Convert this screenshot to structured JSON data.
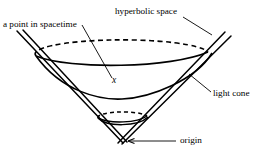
{
  "figure": {
    "type": "diagram",
    "background_color": "#ffffff",
    "stroke_color": "#000000",
    "labels": {
      "a_point_in_spacetime": "a point in spacetime",
      "hyperbolic_space": "hyperbolic space",
      "light_cone": "light cone",
      "origin": "origin",
      "point_x": "x"
    },
    "annotations": [
      {
        "name": "a-point-in-spacetime",
        "text": "a point in spacetime",
        "leader": "line from label down-right to point x",
        "target": "x"
      },
      {
        "name": "hyperbolic-space",
        "text": "hyperbolic space",
        "leader": "line from label down-right to upper cone rim",
        "target": "upper-hyperboloid-rim"
      },
      {
        "name": "light-cone",
        "text": "light cone",
        "leader": "line from label up-left to right cone edge",
        "target": "right-cone-edge"
      },
      {
        "name": "origin",
        "text": "origin",
        "leader": "arrow from label left to cone apex",
        "target": "cone-apex"
      }
    ],
    "geometry": {
      "cone_apex": {
        "x": 122,
        "y": 142
      },
      "upper_rim": {
        "center_x": 122,
        "center_y": 52,
        "radius_x": 87,
        "radius_y": 14,
        "back_arc_style": "dashed",
        "front_arc_style": "solid"
      },
      "lower_rim": {
        "center_x": 122,
        "center_y": 117,
        "radius_x": 25,
        "radius_y": 5,
        "back_arc_style": "dashed",
        "front_arc_style": "solid"
      },
      "upper_hyperbola_min_y": 99,
      "lower_hyperbola_min_y": 126,
      "cone_edges": "two nearly parallel lines on each side from apex outward"
    }
  }
}
